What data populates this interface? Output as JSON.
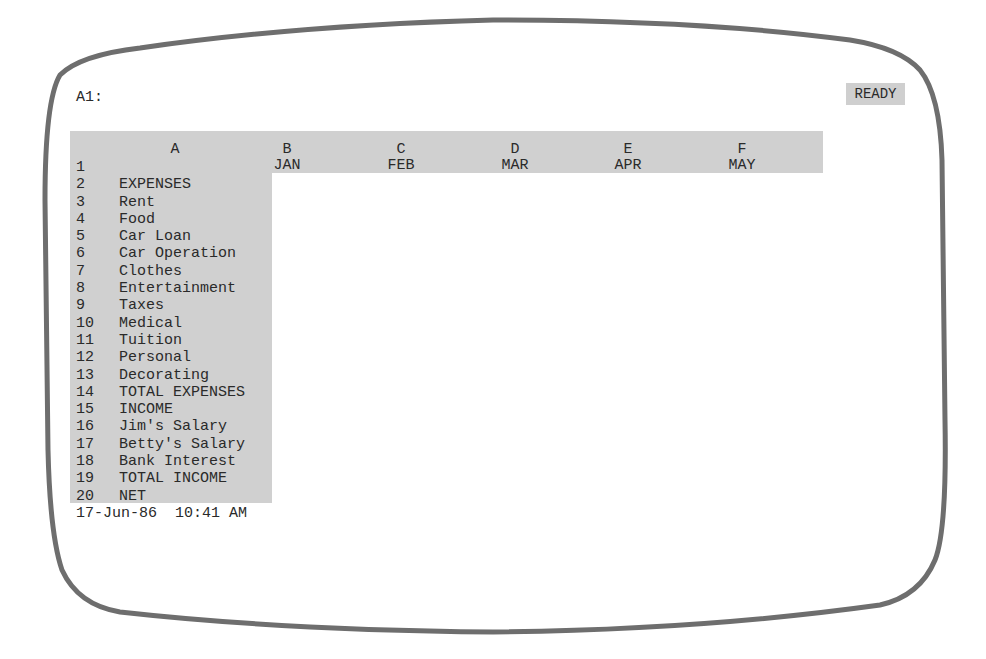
{
  "control_panel": {
    "cell_reference": "A1:",
    "mode_indicator": "READY"
  },
  "columns": [
    {
      "letter": "A",
      "header": ""
    },
    {
      "letter": "B",
      "header": "JAN"
    },
    {
      "letter": "C",
      "header": "FEB"
    },
    {
      "letter": "D",
      "header": "MAR"
    },
    {
      "letter": "E",
      "header": "APR"
    },
    {
      "letter": "F",
      "header": "MAY"
    }
  ],
  "rows": [
    {
      "num": "1",
      "label": ""
    },
    {
      "num": "2",
      "label": "EXPENSES"
    },
    {
      "num": "3",
      "label": "Rent"
    },
    {
      "num": "4",
      "label": "Food"
    },
    {
      "num": "5",
      "label": "Car Loan"
    },
    {
      "num": "6",
      "label": "Car Operation"
    },
    {
      "num": "7",
      "label": "Clothes"
    },
    {
      "num": "8",
      "label": "Entertainment"
    },
    {
      "num": "9",
      "label": "Taxes"
    },
    {
      "num": "10",
      "label": "Medical"
    },
    {
      "num": "11",
      "label": "Tuition"
    },
    {
      "num": "12",
      "label": "Personal"
    },
    {
      "num": "13",
      "label": "Decorating"
    },
    {
      "num": "14",
      "label": "TOTAL EXPENSES"
    },
    {
      "num": "15",
      "label": "INCOME"
    },
    {
      "num": "16",
      "label": "Jim's Salary"
    },
    {
      "num": "17",
      "label": "Betty's Salary"
    },
    {
      "num": "18",
      "label": "Bank Interest"
    },
    {
      "num": "19",
      "label": "TOTAL INCOME"
    },
    {
      "num": "20",
      "label": "NET"
    }
  ],
  "status_line": {
    "date_time": "17-Jun-86  10:41 AM"
  },
  "colors": {
    "highlight_gray": "#d0d0d0",
    "bezel": "#6e6e6e",
    "text": "#2a2a2a"
  }
}
